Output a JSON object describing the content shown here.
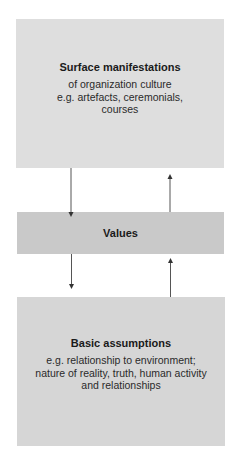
{
  "diagram": {
    "surface": {
      "title": "Surface manifestations",
      "description": "of organization culture\ne.g. artefacts, ceremonials,\ncourses"
    },
    "values": {
      "title": "Values"
    },
    "assumptions": {
      "title": "Basic assumptions",
      "description": "e.g. relationship to environment;\nnature of reality, truth, human activity\nand relationships"
    },
    "colors": {
      "surface_fill": "#dedede",
      "values_fill": "#c9c9c9",
      "assumptions_fill": "#d6d6d6",
      "arrow": "#555555"
    }
  }
}
